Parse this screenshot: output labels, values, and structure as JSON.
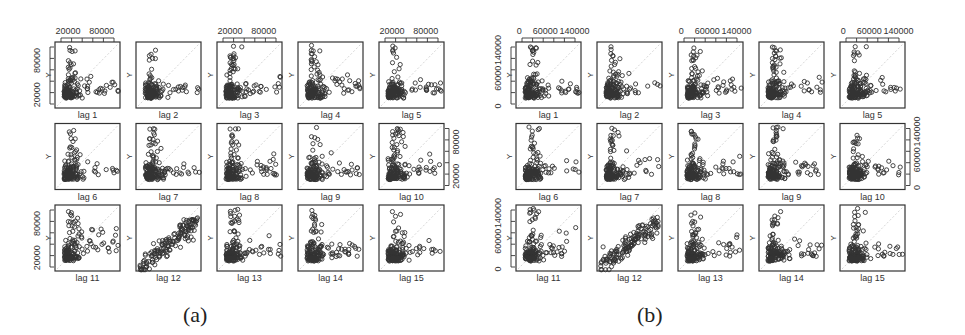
{
  "figure": {
    "captions": [
      "(a)",
      "(b)"
    ],
    "y_label": "Y",
    "lag_label_prefix": "lag "
  },
  "chart_data": [
    {
      "type": "scatter",
      "title": "(a)",
      "description": "Lag plots of series Y against lags 1-15 (3x5 grid)",
      "panels": [
        "lag 1",
        "lag 2",
        "lag 3",
        "lag 4",
        "lag 5",
        "lag 6",
        "lag 7",
        "lag 8",
        "lag 9",
        "lag 10",
        "lag 11",
        "lag 12",
        "lag 13",
        "lag 14",
        "lag 15"
      ],
      "ylabel": "Y",
      "x_ticks_labeled": [
        "20000",
        "80000"
      ],
      "y_ticks_labeled": [
        "20000",
        "80000"
      ],
      "axis_range": [
        5000,
        115000
      ],
      "top_axis_panels": [
        "lag 1",
        "lag 3",
        "lag 5"
      ],
      "left_axis_panels": [
        "lag 1",
        "lag 11"
      ],
      "right_axis_panels": [
        "lag 10"
      ],
      "diagonal_reference_line": true,
      "grid": false
    },
    {
      "type": "scatter",
      "title": "(b)",
      "description": "Lag plots of series Y against lags 1-15 (3x5 grid)",
      "panels": [
        "lag 1",
        "lag 2",
        "lag 3",
        "lag 4",
        "lag 5",
        "lag 6",
        "lag 7",
        "lag 8",
        "lag 9",
        "lag 10",
        "lag 11",
        "lag 12",
        "lag 13",
        "lag 14",
        "lag 15"
      ],
      "ylabel": "Y",
      "x_ticks_labeled": [
        "0",
        "60000",
        "140000"
      ],
      "y_ticks_labeled": [
        "0",
        "60000",
        "140000"
      ],
      "axis_range": [
        0,
        150000
      ],
      "top_axis_panels": [
        "lag 1",
        "lag 3",
        "lag 5"
      ],
      "left_axis_panels": [
        "lag 1",
        "lag 11"
      ],
      "right_axis_panels": [
        "lag 10"
      ],
      "diagonal_reference_line": true,
      "grid": false
    }
  ],
  "layout": {
    "panels": [
      {
        "x0": 55,
        "y0": 42,
        "dx": 81,
        "dy": 81.5,
        "w": 65,
        "h": 66,
        "seed": 11
      },
      {
        "x0": 516,
        "y0": 42,
        "dx": 81,
        "dy": 81.5,
        "w": 65,
        "h": 66,
        "seed": 29
      }
    ],
    "captions_pos": [
      [
        198,
        318
      ],
      [
        652,
        318
      ]
    ]
  }
}
